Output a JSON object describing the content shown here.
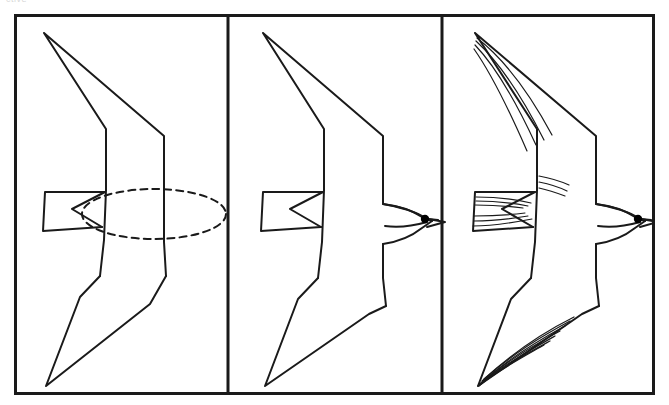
{
  "page": {
    "clipped_caption": "ctive",
    "background_color": "#ffffff",
    "ink_color": "#1a1a1a"
  },
  "plate": {
    "border_color": "#1a1a1a",
    "border_width": 3,
    "frame": {
      "x": 14,
      "y": 14,
      "width": 641,
      "height": 381
    },
    "divider_x": [
      214,
      428
    ],
    "panel_count": 3
  },
  "panels": [
    {
      "id": "panel-1",
      "index": 1,
      "label": "Step 1 — Basic shapes",
      "caption": "",
      "features": [
        "upper-wing-outline",
        "lower-wing-outline",
        "body-axis-lines",
        "tail-fan-outline",
        "dashed-body-ellipse"
      ],
      "guide": {
        "name": "dashed-body-ellipse",
        "style": "dashed",
        "dash_pattern": "7 5",
        "center": [
          140,
          200
        ],
        "rx": 72,
        "ry": 25
      }
    },
    {
      "id": "panel-2",
      "index": 2,
      "label": "Step 2 — Body and head refined",
      "caption": "",
      "features": [
        "upper-wing-outline",
        "lower-wing-outline",
        "body-outline",
        "tail-fan-outline",
        "head-outline",
        "beak",
        "eye-dot"
      ],
      "eye": {
        "name": "eye-dot",
        "fill": "#000000",
        "r": 4.2
      }
    },
    {
      "id": "panel-3",
      "index": 3,
      "label": "Step 3 — Feather detail added",
      "caption": "",
      "features": [
        "upper-wing-outline",
        "lower-wing-outline",
        "body-outline",
        "tail-fan-outline",
        "head-outline",
        "beak",
        "eye-dot",
        "upper-wing-feather-lines",
        "lower-wing-feather-lines",
        "tail-feather-lines",
        "breast-feather-lines"
      ],
      "eye": {
        "name": "eye-dot",
        "fill": "#000000",
        "r": 4.2
      },
      "feather_line_counts": {
        "upper_wing": 4,
        "lower_wing": 7,
        "tail_upper": 3,
        "tail_lower": 3,
        "breast": 3
      }
    }
  ],
  "subject": {
    "name": "soaring-seabird",
    "description": "Line drawing of a gliding seabird seen from below with long swept-back pointed wings, forked body, fanned tail, small head with hooked beak and dark eye",
    "orientation": "facing-right",
    "view": "underside"
  }
}
